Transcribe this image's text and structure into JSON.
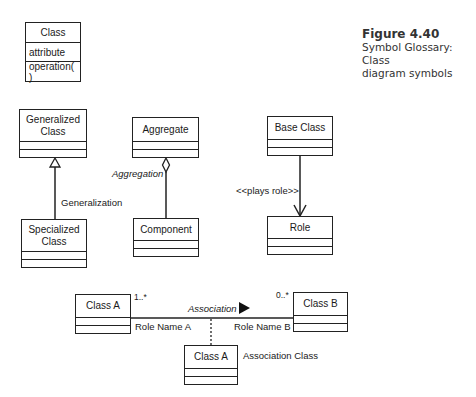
{
  "caption": {
    "title": "Figure 4.40",
    "line1": "Symbol Glossary: Class",
    "line2": "diagram symbols"
  },
  "class_symbol": {
    "name": "Class",
    "attribute": "attribute",
    "operation": "operation( )"
  },
  "generalization": {
    "parent": "Generalized Class",
    "child": "Specialized Class",
    "label": "Generalization"
  },
  "aggregation": {
    "whole": "Aggregate",
    "part": "Component",
    "label": "Aggregation"
  },
  "role": {
    "base": "Base Class",
    "role": "Role",
    "label": "<<plays role>>"
  },
  "association": {
    "class_a": "Class A",
    "class_b": "Class B",
    "label": "Association",
    "multiplicity_a": "1..*",
    "multiplicity_b": "0..*",
    "role_a": "Role Name A",
    "role_b": "Role Name B",
    "association_class": "Class A",
    "association_class_label": "Association Class"
  }
}
